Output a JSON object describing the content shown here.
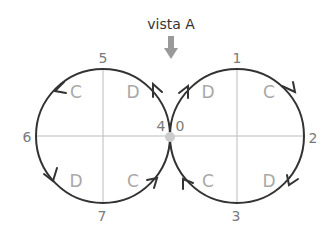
{
  "title": "vista A",
  "colors": {
    "circle": "#333333",
    "axis": "#bbbbbb",
    "arrow": "#9a9a9a",
    "dot": "#cccccc",
    "label": "#7a7a7a",
    "quadrant": "#a8a8a8"
  },
  "points": {
    "p0": "0",
    "p1": "1",
    "p2": "2",
    "p3": "3",
    "p4": "4",
    "p5": "5",
    "p6": "6",
    "p7": "7"
  },
  "quadrants": {
    "left_tl": "C",
    "left_tr": "D",
    "left_bl": "D",
    "left_br": "C",
    "right_tl": "D",
    "right_tr": "C",
    "right_bl": "C",
    "right_br": "D"
  }
}
